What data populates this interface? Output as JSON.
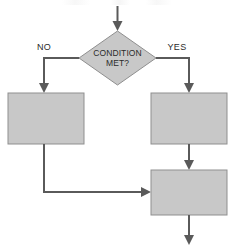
{
  "diagram": {
    "type": "flowchart",
    "title": "",
    "colors": {
      "node_fill": "#c8c8c8",
      "node_stroke": "#8f8f8f",
      "connector": "#5a5a5a",
      "text": "#2b2b2b",
      "background": "#ffffff"
    },
    "nodes": [
      {
        "id": "entry-arrow",
        "shape": "arrow",
        "label": "",
        "name": "entry-arrow"
      },
      {
        "id": "decision",
        "shape": "diamond",
        "label_line1": "CONDITION",
        "label_line2": "MET?",
        "name": "decision-node-condition-met"
      },
      {
        "id": "no-process",
        "shape": "rectangle",
        "label": "",
        "name": "process-box-no-branch"
      },
      {
        "id": "yes-process",
        "shape": "rectangle",
        "label": "",
        "name": "process-box-yes-branch"
      },
      {
        "id": "merge-process",
        "shape": "rectangle",
        "label": "",
        "name": "process-box-merge"
      },
      {
        "id": "exit-arrow",
        "shape": "arrow",
        "label": "",
        "name": "exit-arrow"
      }
    ],
    "edges": [
      {
        "id": "edge-entry",
        "from": "entry-arrow",
        "to": "decision",
        "label": ""
      },
      {
        "id": "edge-no",
        "from": "decision",
        "to": "no-process",
        "label": "NO"
      },
      {
        "id": "edge-yes",
        "from": "decision",
        "to": "yes-process",
        "label": "YES"
      },
      {
        "id": "edge-no-merge",
        "from": "no-process",
        "to": "merge-process",
        "label": ""
      },
      {
        "id": "edge-yes-merge",
        "from": "yes-process",
        "to": "merge-process",
        "label": ""
      },
      {
        "id": "edge-exit",
        "from": "merge-process",
        "to": "exit-arrow",
        "label": ""
      }
    ]
  }
}
